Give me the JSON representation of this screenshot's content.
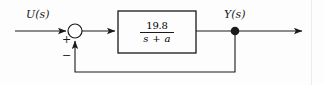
{
  "diagram": {
    "type": "control-system-block-diagram",
    "title": "",
    "background_color": "#fdfdfd",
    "line_color": "#1a1a1a",
    "input_signal": {
      "label": "U(s)",
      "name": "input-signal-label"
    },
    "output_signal": {
      "label": "Y(s)",
      "name": "output-signal-label"
    },
    "summing_junction": {
      "name": "summing-junction",
      "shape": "circle",
      "input_sign": "+",
      "feedback_sign": "−"
    },
    "plant_block": {
      "name": "plant-transfer-function-block",
      "numerator": "19.8",
      "denominator": "s + a",
      "expression": "19.8/(s + a)"
    },
    "feedback": {
      "name": "feedback-path",
      "gain": "1",
      "type": "unity-negative-feedback",
      "label": ""
    },
    "takeoff_node": {
      "name": "output-takeoff-node"
    },
    "arrows": [
      "input-arrow",
      "summing-junction-to-block-arrow",
      "feedback-up-arrow",
      "output-arrow"
    ]
  }
}
